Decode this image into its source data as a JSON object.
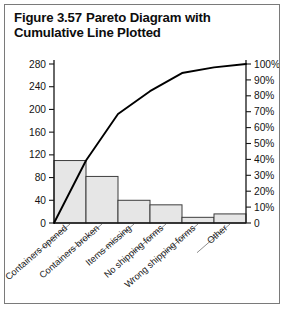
{
  "figure": {
    "number": "Figure 3.57",
    "title": "Pareto Diagram with Cumulative Line Plotted"
  },
  "chart_data": {
    "type": "bar",
    "title": "Pareto Diagram with Cumulative Line Plotted",
    "xlabel": "",
    "ylabel": "",
    "y2label": "",
    "grid": false,
    "legend": "none",
    "categories": [
      "Containers opened",
      "Containers broken",
      "Items missing",
      "No shipping forms",
      "Wrong shipping forms",
      "Other"
    ],
    "values": [
      110,
      82,
      40,
      32,
      10,
      16
    ],
    "ylim": [
      0,
      280
    ],
    "yticks": [
      0,
      40,
      80,
      120,
      160,
      200,
      240,
      280
    ],
    "ytick_labels": [
      "0",
      "40",
      "80",
      "120",
      "160",
      "200",
      "240",
      "280"
    ],
    "y2lim": [
      0,
      100
    ],
    "y2ticks": [
      0,
      10,
      20,
      30,
      40,
      50,
      60,
      70,
      80,
      90,
      100
    ],
    "y2tick_labels": [
      "0",
      "10%",
      "20%",
      "30%",
      "40%",
      "50%",
      "60%",
      "70%",
      "80%",
      "90%",
      "100%"
    ],
    "series": [
      {
        "name": "Count",
        "type": "bar",
        "values": [
          110,
          82,
          40,
          32,
          10,
          16
        ]
      },
      {
        "name": "Cumulative percent",
        "type": "line",
        "axis": "secondary",
        "values": [
          39.3,
          68.6,
          82.9,
          94.3,
          97.9,
          100.0
        ],
        "start_at_origin": true
      }
    ],
    "colors": {
      "bar_fill": "#e6e6e6",
      "bar_stroke": "#3d3d3d",
      "line": "#000000",
      "axis": "#161616",
      "text": "#131313",
      "frame": "#7a7a7a"
    }
  }
}
